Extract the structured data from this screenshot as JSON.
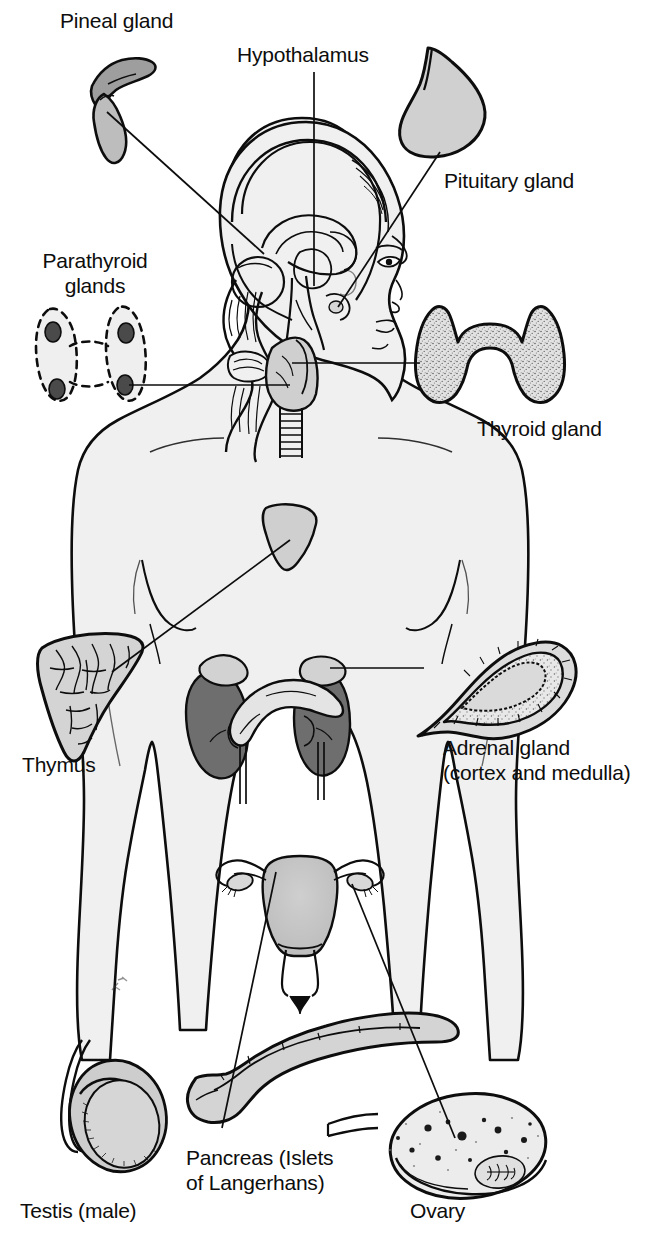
{
  "figure": {
    "background_color": "#ffffff",
    "ink_color": "#0d0d0d",
    "body_fill": "#f0f0f0",
    "organ_fill": "#c9c9c9",
    "kidney_fill": "#6e6e6e",
    "nodule_fill": "#4a4a4a"
  },
  "labels": [
    {
      "id": "pineal",
      "text": "Pineal gland",
      "x": 60,
      "y": 8,
      "align": "left"
    },
    {
      "id": "hypothalamus",
      "text": "Hypothalamus",
      "x": 237,
      "y": 42,
      "align": "left"
    },
    {
      "id": "pituitary",
      "text": "Pituitary gland",
      "x": 444,
      "y": 168,
      "align": "left"
    },
    {
      "id": "parathyroid",
      "text": "Parathyroid\nglands",
      "x": 30,
      "y": 248,
      "align": "left"
    },
    {
      "id": "thyroid",
      "text": "Thyroid gland",
      "x": 477,
      "y": 416,
      "align": "left"
    },
    {
      "id": "thymus",
      "text": "Thymus",
      "x": 22,
      "y": 752,
      "align": "left"
    },
    {
      "id": "adrenal",
      "text": "Adrenal gland\n(cortex and medulla)",
      "x": 443,
      "y": 735,
      "align": "left"
    },
    {
      "id": "testis",
      "text": "Testis (male)",
      "x": 20,
      "y": 1198,
      "align": "left"
    },
    {
      "id": "pancreas",
      "text": "Pancreas (Islets\nof Langerhans)",
      "x": 186,
      "y": 1145,
      "align": "left"
    },
    {
      "id": "ovary",
      "text": "Ovary",
      "x": 410,
      "y": 1198,
      "align": "left"
    }
  ],
  "glands": [
    {
      "id": "pineal-gland",
      "name": "Pineal gland",
      "location": "inset top-left"
    },
    {
      "id": "hypothalamus",
      "name": "Hypothalamus",
      "location": "brain midline"
    },
    {
      "id": "pituitary-gland",
      "name": "Pituitary gland",
      "location": "inset top-right"
    },
    {
      "id": "parathyroid-glands",
      "name": "Parathyroid glands",
      "location": "inset mid-left"
    },
    {
      "id": "thyroid-gland",
      "name": "Thyroid gland",
      "location": "inset mid-right"
    },
    {
      "id": "thymus",
      "name": "Thymus",
      "location": "inset left chest"
    },
    {
      "id": "adrenal-gland",
      "name": "Adrenal gland (cortex and medulla)",
      "location": "inset right"
    },
    {
      "id": "pancreas",
      "name": "Pancreas (Islets of Langerhans)",
      "location": "inset bottom-center"
    },
    {
      "id": "testis",
      "name": "Testis (male)",
      "location": "inset bottom-left"
    },
    {
      "id": "ovary",
      "name": "Ovary",
      "location": "inset bottom-right"
    }
  ],
  "leader_lines": [
    {
      "from": "pineal-gland",
      "to": "brain-pineal-region"
    },
    {
      "from": "hypothalamus",
      "to": "brain-hypothalamus"
    },
    {
      "from": "pituitary-gland",
      "to": "brain-sella"
    },
    {
      "from": "parathyroid-glands",
      "to": "neck-thyroid"
    },
    {
      "from": "thyroid-gland",
      "to": "neck-thyroid"
    },
    {
      "from": "thymus",
      "to": "chest-thymus"
    },
    {
      "from": "adrenal-gland",
      "to": "kidney-adrenal-cap"
    },
    {
      "from": "pancreas",
      "to": "abdomen-pancreas"
    },
    {
      "from": "ovary",
      "to": "pelvis-ovary"
    }
  ]
}
